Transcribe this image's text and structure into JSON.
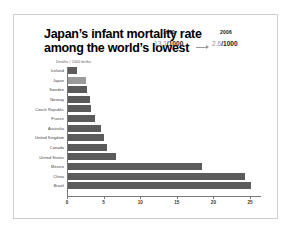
{
  "slide": {
    "title_line1": "Japan’s infant mortality rate",
    "title_line2": "among the world’s lowest",
    "axis_note": "Deaths / 1000 births"
  },
  "callout": {
    "year_from": "1970",
    "year_to": "2006",
    "value_from_num": "13.1",
    "value_from_den": "/1000",
    "value_to_num": "2.6",
    "value_to_den": "/1000",
    "arrow": "right-arrow-icon"
  },
  "colors": {
    "bar": "#5b5b5b",
    "bar_highlight": "#9a9a9a",
    "axis": "#777777",
    "frame": "#cfcfcf",
    "background": "#ffffff",
    "stat_number": "#8f8f8f"
  },
  "chart_data": {
    "type": "bar",
    "orientation": "horizontal",
    "subtitle": "",
    "xlabel": "Deaths / 1000 births",
    "ylabel": "",
    "xlim": [
      0,
      26.5
    ],
    "xticks": [
      0,
      5,
      10,
      15,
      20,
      25
    ],
    "xtick_labels": [
      "0",
      "5",
      "10",
      "15",
      "20",
      "25"
    ],
    "grid": false,
    "legend": "none",
    "highlight_category": "Japan",
    "categories": [
      "Iceland",
      "Japan",
      "Sweden",
      "Norway",
      "Czech Republic",
      "France",
      "Australia",
      "United Kingdom",
      "Canada",
      "United States",
      "Mexico",
      "China",
      "Brazil"
    ],
    "values": [
      1.4,
      2.6,
      2.8,
      3.2,
      3.3,
      3.8,
      4.6,
      5.0,
      5.4,
      6.7,
      18.4,
      24.3,
      25.2
    ],
    "annotations": [
      {
        "label": "1970",
        "value": "13.1/1000"
      },
      {
        "label": "2006",
        "value": "2.6/1000"
      }
    ]
  }
}
